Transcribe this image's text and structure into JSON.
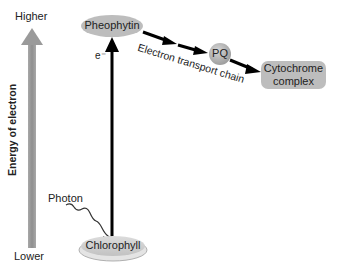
{
  "axis": {
    "title": "Energy of electron",
    "top_label": "Higher",
    "bottom_label": "Lower",
    "arrow_color": "#9a9a9a"
  },
  "nodes": {
    "pheophytin": "Pheophytin",
    "pq": "PQ",
    "cytochrome_line1": "Cytochrome",
    "cytochrome_line2": "complex",
    "chlorophyll": "Chlorophyll"
  },
  "labels": {
    "electron": "e⁻",
    "photon": "Photon",
    "etc": "Electron transport chain"
  },
  "colors": {
    "node_fill": "#bdbdbd",
    "arrow": "#000000"
  }
}
